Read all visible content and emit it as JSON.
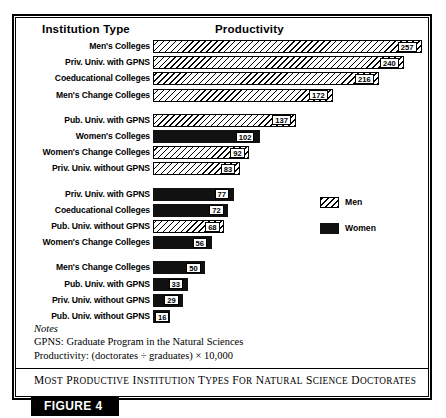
{
  "figure": {
    "tag_label": "FIGURE 4",
    "caption": "Most Productive Institution Types for Natural Science Doctorates"
  },
  "headers": {
    "institution_type": "Institution Type",
    "productivity": "Productivity"
  },
  "legend": {
    "position": "right-middle",
    "items": [
      {
        "label": "Men",
        "pattern": "diagonal-hatch",
        "color": "#ffffff"
      },
      {
        "label": "Women",
        "pattern": "solid",
        "color": "#111111"
      }
    ]
  },
  "notes": {
    "heading": "Notes",
    "lines": [
      "GPNS: Graduate Program in the Natural Sciences",
      "Productivity: (doctorates ÷ graduates) × 10,000"
    ]
  },
  "chart_data": {
    "type": "bar",
    "orientation": "horizontal",
    "title": "Most Productive Institution Types for Natural Science Doctorates",
    "xlabel": "Productivity",
    "ylabel": "Institution Type",
    "xlim": [
      0,
      260
    ],
    "grid": false,
    "legend_position": "right-middle",
    "series": [
      {
        "name": "Men",
        "pattern": "diagonal-hatch"
      },
      {
        "name": "Women",
        "pattern": "solid"
      }
    ],
    "groups": [
      {
        "group_index": 1,
        "bars": [
          {
            "category": "Men's Colleges",
            "series": "Men",
            "value": 257
          },
          {
            "category": "Priv. Univ. with GPNS",
            "series": "Men",
            "value": 240
          },
          {
            "category": "Coeducational Colleges",
            "series": "Men",
            "value": 216
          },
          {
            "category": "Men's Change Colleges",
            "series": "Men",
            "value": 172
          }
        ]
      },
      {
        "group_index": 2,
        "bars": [
          {
            "category": "Pub. Univ. with GPNS",
            "series": "Men",
            "value": 137
          },
          {
            "category": "Women's Colleges",
            "series": "Women",
            "value": 102
          },
          {
            "category": "Women's Change Colleges",
            "series": "Men",
            "value": 92
          },
          {
            "category": "Priv. Univ. without GPNS",
            "series": "Men",
            "value": 83
          }
        ]
      },
      {
        "group_index": 3,
        "bars": [
          {
            "category": "Priv. Univ. with GPNS",
            "series": "Women",
            "value": 77
          },
          {
            "category": "Coeducational Colleges",
            "series": "Women",
            "value": 72
          },
          {
            "category": "Pub. Univ. without GPNS",
            "series": "Men",
            "value": 68
          },
          {
            "category": "Women's Change Colleges",
            "series": "Women",
            "value": 56
          }
        ]
      },
      {
        "group_index": 4,
        "bars": [
          {
            "category": "Men's Change Colleges",
            "series": "Women",
            "value": 50
          },
          {
            "category": "Pub. Univ. with GPNS",
            "series": "Women",
            "value": 33
          },
          {
            "category": "Priv. Univ. without GPNS",
            "series": "Women",
            "value": 29
          },
          {
            "category": "Pub. Univ. without GPNS",
            "series": "Women",
            "value": 16
          }
        ]
      }
    ]
  }
}
